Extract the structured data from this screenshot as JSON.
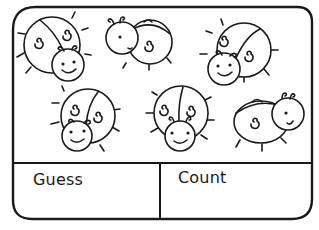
{
  "worksheet": {
    "subject": "ladybirds",
    "ladybird_count_drawn": 6,
    "colors": {
      "ink": "#1a1a1a",
      "paper": "#ffffff"
    }
  },
  "answer_boxes": {
    "guess_label": "Guess",
    "count_label": "Count"
  }
}
